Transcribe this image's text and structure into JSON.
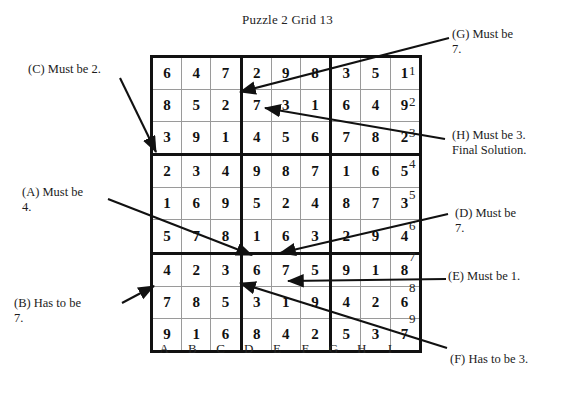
{
  "title": "Puzzle 2  Grid 13",
  "grid": {
    "column_labels": [
      "A",
      "B",
      "C",
      "D",
      "E",
      "F",
      "G",
      "H",
      "I"
    ],
    "row_labels": [
      "1",
      "2",
      "3",
      "4",
      "5",
      "6",
      "7",
      "8",
      "9"
    ],
    "rows": [
      [
        "6",
        "4",
        "7",
        "2",
        "9",
        "8",
        "3",
        "5",
        "1"
      ],
      [
        "8",
        "5",
        "2",
        "7",
        "3",
        "1",
        "6",
        "4",
        "9"
      ],
      [
        "3",
        "9",
        "1",
        "4",
        "5",
        "6",
        "7",
        "8",
        "2"
      ],
      [
        "2",
        "3",
        "4",
        "9",
        "8",
        "7",
        "1",
        "6",
        "5"
      ],
      [
        "1",
        "6",
        "9",
        "5",
        "2",
        "4",
        "8",
        "7",
        "3"
      ],
      [
        "5",
        "7",
        "8",
        "1",
        "6",
        "3",
        "2",
        "9",
        "4"
      ],
      [
        "4",
        "2",
        "3",
        "6",
        "7",
        "5",
        "9",
        "1",
        "8"
      ],
      [
        "7",
        "8",
        "5",
        "3",
        "1",
        "9",
        "4",
        "2",
        "6"
      ],
      [
        "9",
        "1",
        "6",
        "8",
        "4",
        "2",
        "5",
        "3",
        "7"
      ]
    ]
  },
  "annotations": [
    {
      "id": "C",
      "text": "(C) Must be 2."
    },
    {
      "id": "A",
      "text": "(A) Must be\n4."
    },
    {
      "id": "B",
      "text": "(B) Has to be\n7."
    },
    {
      "id": "G",
      "text": "(G) Must be\n7."
    },
    {
      "id": "H",
      "text": "(H) Must be 3.\nFinal Solution."
    },
    {
      "id": "D",
      "text": "(D) Must be\n7."
    },
    {
      "id": "E",
      "text": "(E) Must be 1."
    },
    {
      "id": "F",
      "text": "(F) Has to be 3."
    }
  ],
  "colors": {
    "ink": "#111111",
    "grid_line": "#9a9a9a",
    "background": "#ffffff"
  }
}
